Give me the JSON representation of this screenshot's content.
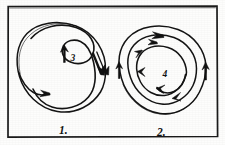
{
  "figure": {
    "background_color": "#fdfdfc",
    "ink_color": "#141414",
    "frame": {
      "label": "figure-border",
      "stroke": "#1a1a1a",
      "x": 7,
      "y": 6,
      "width": 211,
      "height": 131
    },
    "panels": [
      {
        "id": "panel-1",
        "caption": "1.",
        "inner_label": "3",
        "kind": "s-curve-circulation",
        "center_x": 62,
        "center_y": 66,
        "radius": 44,
        "arrow_count": 3,
        "description": "Circle containing an S-shaped dividing curve with arrows indicating two counter-rotating lobes"
      },
      {
        "id": "panel-2",
        "caption": "2.",
        "inner_label": "4",
        "kind": "concentric-vortex",
        "center_x": 163,
        "center_y": 71,
        "radius": 44,
        "ring_count": 3,
        "arrow_count": 7,
        "description": "Concentric circular streamlines with arrows indicating a spiralling vortex"
      }
    ],
    "captions": [
      {
        "text": "1.",
        "x": 64,
        "y": 133
      },
      {
        "text": "2.",
        "x": 163,
        "y": 134
      }
    ],
    "inner_labels": [
      {
        "text": "3",
        "x": 73,
        "y": 60
      },
      {
        "text": "4",
        "x": 166,
        "y": 76
      }
    ]
  }
}
